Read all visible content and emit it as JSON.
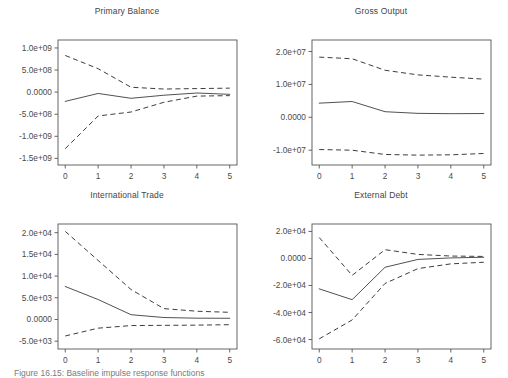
{
  "figure": {
    "caption": "Figure 16.15: Baseline impulse response functions",
    "background_color": "#ffffff",
    "line_color": "#3d3d3d"
  },
  "chart_data": [
    {
      "type": "line",
      "panel_index": 0,
      "title": "Primary Balance",
      "xlabel": "",
      "ylabel": "",
      "x": [
        0,
        1,
        2,
        3,
        4,
        5
      ],
      "xlim": [
        -0.22,
        5.22
      ],
      "ylim": [
        -1650000000,
        1180000000
      ],
      "xticks": [
        0,
        1,
        2,
        3,
        4,
        5
      ],
      "xticklabels": [
        "0",
        "1",
        "2",
        "3",
        "4",
        "5"
      ],
      "yticks": [
        1000000000,
        500000000,
        0,
        -500000000,
        -1000000000,
        -1500000000
      ],
      "yticklabels": [
        "1.0e+09",
        "5.0e+08",
        "0.0000",
        "-5.0e+08",
        "-1.0e+09",
        "-1.5e+09"
      ],
      "grid": false,
      "legend": "none",
      "series": [
        {
          "name": "upper",
          "style": "dashed",
          "values": [
            830000000,
            530000000,
            110000000,
            70000000,
            80000000,
            90000000
          ]
        },
        {
          "name": "mean",
          "style": "solid",
          "values": [
            -210000000,
            -30000000,
            -140000000,
            -70000000,
            -20000000,
            -50000000
          ]
        },
        {
          "name": "lower",
          "style": "dashed",
          "values": [
            -1280000000,
            -540000000,
            -450000000,
            -230000000,
            -90000000,
            -80000000
          ]
        }
      ]
    },
    {
      "type": "line",
      "panel_index": 1,
      "title": "Gross Output",
      "xlabel": "",
      "ylabel": "",
      "x": [
        0,
        1,
        2,
        3,
        4,
        5
      ],
      "xlim": [
        -0.22,
        5.22
      ],
      "ylim": [
        -14500000,
        23500000
      ],
      "xticks": [
        0,
        1,
        2,
        3,
        4,
        5
      ],
      "xticklabels": [
        "0",
        "1",
        "2",
        "3",
        "4",
        "5"
      ],
      "yticks": [
        20000000,
        10000000,
        0,
        -10000000
      ],
      "yticklabels": [
        "2.0e+07",
        "1.0e+07",
        "0.0000",
        "-1.0e+07"
      ],
      "grid": false,
      "legend": "none",
      "series": [
        {
          "name": "upper",
          "style": "dashed",
          "values": [
            18300000,
            17800000,
            14300000,
            12900000,
            12200000,
            11600000
          ]
        },
        {
          "name": "mean",
          "style": "solid",
          "values": [
            4300000,
            4800000,
            1700000,
            1200000,
            1100000,
            1150000
          ]
        },
        {
          "name": "lower",
          "style": "dashed",
          "values": [
            -9800000,
            -10000000,
            -11300000,
            -11500000,
            -11400000,
            -11000000
          ]
        }
      ]
    },
    {
      "type": "line",
      "panel_index": 2,
      "title": "International Trade",
      "xlabel": "",
      "ylabel": "",
      "x": [
        0,
        1,
        2,
        3,
        4,
        5
      ],
      "xlim": [
        -0.22,
        5.22
      ],
      "ylim": [
        -6800,
        22000
      ],
      "xticks": [
        0,
        1,
        2,
        3,
        4,
        5
      ],
      "xticklabels": [
        "0",
        "1",
        "2",
        "3",
        "4",
        "5"
      ],
      "yticks": [
        20000,
        15000,
        10000,
        5000,
        0,
        -5000
      ],
      "yticklabels": [
        "2.0e+04",
        "1.5e+04",
        "1.0e+04",
        "5.0e+03",
        "0.0000",
        "-5.0e+03"
      ],
      "grid": false,
      "legend": "none",
      "series": [
        {
          "name": "upper",
          "style": "dashed",
          "values": [
            20300,
            13600,
            6900,
            2500,
            1900,
            1650
          ]
        },
        {
          "name": "mean",
          "style": "solid",
          "values": [
            7600,
            4600,
            1100,
            450,
            300,
            280
          ]
        },
        {
          "name": "lower",
          "style": "dashed",
          "values": [
            -3800,
            -2000,
            -1400,
            -1350,
            -1300,
            -1200
          ]
        }
      ]
    },
    {
      "type": "line",
      "panel_index": 3,
      "title": "External Debt",
      "xlabel": "",
      "ylabel": "",
      "x": [
        0,
        1,
        2,
        3,
        4,
        5
      ],
      "xlim": [
        -0.22,
        5.22
      ],
      "ylim": [
        -67000,
        25500
      ],
      "xticks": [
        0,
        1,
        2,
        3,
        4,
        5
      ],
      "xticklabels": [
        "0",
        "1",
        "2",
        "3",
        "4",
        "5"
      ],
      "yticks": [
        20000,
        0,
        -20000,
        -40000,
        -60000
      ],
      "yticklabels": [
        "2.0e+04",
        "0.0000",
        "-2.0e+04",
        "-4.0e+04",
        "-6.0e+04"
      ],
      "grid": false,
      "legend": "none",
      "series": [
        {
          "name": "upper",
          "style": "dashed",
          "values": [
            15500,
            -12500,
            6500,
            3000,
            1800,
            1500
          ]
        },
        {
          "name": "mean",
          "style": "solid",
          "values": [
            -22500,
            -30500,
            -6500,
            -700,
            400,
            900
          ]
        },
        {
          "name": "lower",
          "style": "dashed",
          "values": [
            -59500,
            -45500,
            -18500,
            -7500,
            -4000,
            -2800
          ]
        }
      ]
    }
  ]
}
